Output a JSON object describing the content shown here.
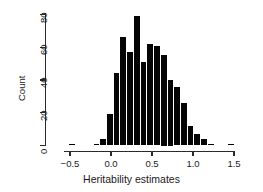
{
  "chart_data": {
    "type": "bar",
    "title": "",
    "xlabel": "Heritability estimates",
    "ylabel": "Count",
    "xlim": [
      -0.55,
      1.6
    ],
    "ylim": [
      0,
      82
    ],
    "grid": false,
    "legend": null,
    "bin_width": 0.082,
    "xticks": [
      -0.5,
      0.0,
      0.5,
      1.0,
      1.5
    ],
    "xtick_labels": [
      "−0.5",
      "0.0",
      "0.5",
      "1.0",
      "1.5"
    ],
    "yticks": [
      0,
      20,
      40,
      60,
      80
    ],
    "ytick_labels": [
      "0",
      "20",
      "40",
      "60",
      "80"
    ],
    "bar_color": "#050505",
    "axis_color": "#2a2a2a",
    "bins": [
      {
        "x0": -0.52,
        "x1": -0.438,
        "value": 1
      },
      {
        "x0": -0.225,
        "x1": -0.143,
        "value": 1
      },
      {
        "x0": -0.143,
        "x1": -0.061,
        "value": 4
      },
      {
        "x0": -0.061,
        "x1": 0.021,
        "value": 19
      },
      {
        "x0": 0.021,
        "x1": 0.103,
        "value": 44
      },
      {
        "x0": 0.103,
        "x1": 0.185,
        "value": 66
      },
      {
        "x0": 0.185,
        "x1": 0.267,
        "value": 57
      },
      {
        "x0": 0.267,
        "x1": 0.349,
        "value": 79
      },
      {
        "x0": 0.349,
        "x1": 0.431,
        "value": 51
      },
      {
        "x0": 0.431,
        "x1": 0.513,
        "value": 62
      },
      {
        "x0": 0.513,
        "x1": 0.595,
        "value": 61
      },
      {
        "x0": 0.595,
        "x1": 0.677,
        "value": 55
      },
      {
        "x0": 0.677,
        "x1": 0.759,
        "value": 40
      },
      {
        "x0": 0.759,
        "x1": 0.841,
        "value": 36
      },
      {
        "x0": 0.841,
        "x1": 0.923,
        "value": 26
      },
      {
        "x0": 0.923,
        "x1": 1.005,
        "value": 12
      },
      {
        "x0": 1.005,
        "x1": 1.087,
        "value": 7
      },
      {
        "x0": 1.087,
        "x1": 1.169,
        "value": 4
      },
      {
        "x0": 1.169,
        "x1": 1.251,
        "value": 1
      },
      {
        "x0": 1.415,
        "x1": 1.497,
        "value": 1
      }
    ]
  }
}
